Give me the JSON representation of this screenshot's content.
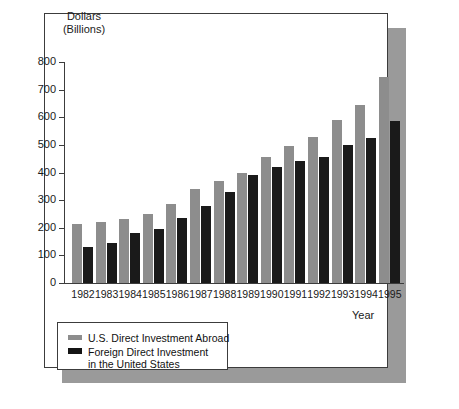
{
  "figure": {
    "ylabel_line1": "Dollars",
    "ylabel_line2": "(Billions)",
    "xlabel": "Year"
  },
  "legend": {
    "items": [
      {
        "label": "U.S. Direct Investment Abroad",
        "color": "#8d8d8d",
        "swatch": "gray-bar-swatch"
      },
      {
        "label": "Foreign Direct Investment",
        "label_line2": "in the United States",
        "color": "#141414",
        "swatch": "black-bar-swatch"
      }
    ]
  },
  "colors": {
    "series_us_abroad": "#8d8d8d",
    "series_foreign_in_us": "#1a1a1a",
    "axis": "#3c3c3c",
    "frame": "#3c3c3c",
    "shadow": "#9a9a9a",
    "background": "#ffffff"
  },
  "chart_data": {
    "type": "bar",
    "title": "",
    "subtitle": "",
    "xlabel": "Year",
    "ylabel": "Dollars (Billions)",
    "ylim": [
      0,
      800
    ],
    "yticks": [
      0,
      100,
      200,
      300,
      400,
      500,
      600,
      700,
      800
    ],
    "ytick_labels": [
      "0",
      "100",
      "200",
      "300",
      "400",
      "500",
      "600",
      "700",
      "800"
    ],
    "grid": false,
    "legend_position": "below-plot-left",
    "categories": [
      "1982",
      "1983",
      "1984",
      "1985",
      "1986",
      "1987",
      "1988",
      "1989",
      "1990",
      "1991",
      "1992",
      "1993",
      "1994",
      "1995"
    ],
    "series": [
      {
        "name": "U.S. Direct Investment Abroad",
        "color": "#8d8d8d",
        "values": [
          215,
          220,
          230,
          250,
          285,
          340,
          370,
          400,
          455,
          495,
          530,
          590,
          645,
          745
        ]
      },
      {
        "name": "Foreign Direct Investment in the United States",
        "color": "#1a1a1a",
        "values": [
          130,
          145,
          180,
          195,
          235,
          280,
          330,
          390,
          420,
          440,
          455,
          500,
          525,
          585
        ]
      }
    ]
  }
}
